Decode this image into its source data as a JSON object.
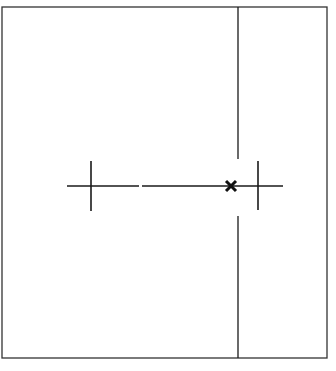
{
  "diagram": {
    "colors": {
      "background": "#ffffff",
      "stroke": "#1a1a1a",
      "frame": "#333333"
    },
    "frame": {
      "x": 2,
      "y": 7,
      "width": 325,
      "height": 351
    },
    "vertical_line": {
      "x": 238,
      "top_segment": {
        "y1": 7,
        "y2": 159
      },
      "bottom_segment": {
        "y1": 216,
        "y2": 358
      }
    },
    "horizontal_line": {
      "y": 186,
      "segments": [
        {
          "x1": 67,
          "x2": 139
        },
        {
          "x1": 142,
          "x2": 283
        }
      ]
    },
    "ticks": [
      {
        "name": "left-tick",
        "x": 91,
        "y1": 161,
        "y2": 211
      },
      {
        "name": "right-tick",
        "x": 258,
        "y1": 161,
        "y2": 210
      }
    ],
    "marker": {
      "symbol": "x",
      "cx": 231,
      "cy": 186,
      "size": 10
    }
  }
}
